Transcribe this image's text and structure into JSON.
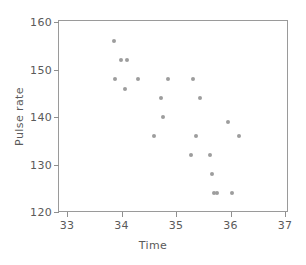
{
  "chart_data": {
    "type": "scatter",
    "title": "",
    "xlabel": "Time",
    "ylabel": "Pulse rate",
    "xlim": [
      33,
      37
    ],
    "ylim": [
      120,
      160
    ],
    "xticks": [
      33,
      34,
      35,
      36,
      37
    ],
    "yticks": [
      120,
      130,
      140,
      150,
      160
    ],
    "xtick_labels": [
      "33",
      "34",
      "35",
      "36",
      "37"
    ],
    "ytick_labels": [
      "120",
      "130",
      "140",
      "150",
      "160"
    ],
    "grid": false,
    "legend": null,
    "marker_color": "#9d9d9d",
    "axis_color": "#9a9a9a",
    "text_color": "#5a5a5a",
    "points": [
      {
        "x": 33.86,
        "y": 156
      },
      {
        "x": 33.99,
        "y": 152
      },
      {
        "x": 34.11,
        "y": 152
      },
      {
        "x": 33.88,
        "y": 148
      },
      {
        "x": 34.06,
        "y": 146
      },
      {
        "x": 34.31,
        "y": 148
      },
      {
        "x": 34.6,
        "y": 136
      },
      {
        "x": 34.72,
        "y": 144
      },
      {
        "x": 34.76,
        "y": 140
      },
      {
        "x": 34.86,
        "y": 148
      },
      {
        "x": 35.31,
        "y": 148
      },
      {
        "x": 35.27,
        "y": 132
      },
      {
        "x": 35.37,
        "y": 136
      },
      {
        "x": 35.44,
        "y": 144
      },
      {
        "x": 35.62,
        "y": 132
      },
      {
        "x": 35.66,
        "y": 128
      },
      {
        "x": 35.69,
        "y": 124
      },
      {
        "x": 35.75,
        "y": 124
      },
      {
        "x": 35.95,
        "y": 139
      },
      {
        "x": 36.02,
        "y": 124
      },
      {
        "x": 36.15,
        "y": 136
      }
    ]
  }
}
